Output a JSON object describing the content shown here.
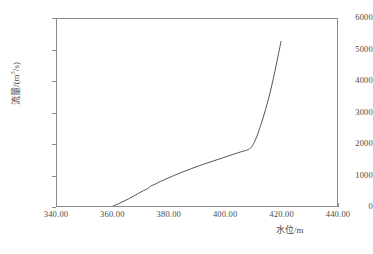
{
  "chart_data": {
    "type": "line",
    "title": "",
    "subtitle": "",
    "xlabel": "水位/m",
    "ylabel_prefix": "流量/(m",
    "ylabel_sup": "3",
    "ylabel_suffix": "/s)",
    "ylabel_full": "流量/(m3/s)",
    "xlim": [
      340.0,
      440.0
    ],
    "ylim": [
      0,
      6000
    ],
    "xticks": [
      "340.00",
      "360.00",
      "380.00",
      "400.00",
      "420.00",
      "440.00"
    ],
    "xtick_values": [
      340.0,
      360.0,
      380.0,
      400.0,
      420.0,
      440.0
    ],
    "yticks": [
      "0",
      "1000",
      "2000",
      "3000",
      "4000",
      "5000",
      "6000"
    ],
    "ytick_values": [
      0,
      1000,
      2000,
      3000,
      4000,
      5000,
      6000
    ],
    "grid": false,
    "legend": null,
    "series": [
      {
        "name": "水位流量关系曲线",
        "color": "#404040",
        "x": [
          360.0,
          362.0,
          364.0,
          366.0,
          368.0,
          370.0,
          371.5,
          372.5,
          373.5,
          375.0,
          377.0,
          380.0,
          384.0,
          388.0,
          392.0,
          396.0,
          400.0,
          404.0,
          406.5,
          408.0,
          409.5,
          411.0,
          412.5,
          414.0,
          416.0,
          418.0,
          420.0
        ],
        "y": [
          0,
          75,
          160,
          250,
          350,
          450,
          520,
          560,
          640,
          700,
          790,
          910,
          1060,
          1200,
          1330,
          1450,
          1570,
          1690,
          1760,
          1800,
          1900,
          2150,
          2520,
          2950,
          3600,
          4400,
          5280
        ]
      }
    ]
  },
  "axes": {
    "frame_color": "#8c8c8c",
    "line_color": "#404040"
  }
}
